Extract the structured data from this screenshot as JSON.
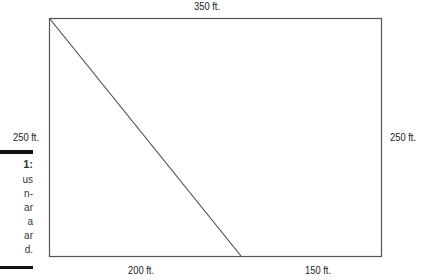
{
  "diagram": {
    "shape": "rectangle-divided-by-diagonal",
    "labels": {
      "top": "350 ft.",
      "left": "250 ft.",
      "right": "250 ft.",
      "bottom_left": "200 ft.",
      "bottom_right": "150 ft."
    },
    "line_color": "#555555"
  },
  "caption": {
    "heading": "1:",
    "lines": [
      "us",
      "n-",
      "ar",
      "a",
      "ar",
      "d."
    ]
  }
}
